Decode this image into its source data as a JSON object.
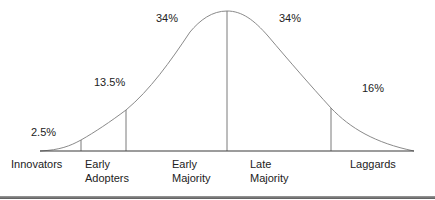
{
  "diagram": {
    "type": "bell-curve",
    "colors": {
      "curve": "#8a8a8a",
      "dividers": "#7a7a7a",
      "baseline": "#3a3a3a",
      "text": "#222222",
      "bottom_rule": "#6a6a6a"
    },
    "percentages": [
      {
        "id": "innovators",
        "value": "2.5%"
      },
      {
        "id": "early-adopters",
        "value": "13.5%"
      },
      {
        "id": "early-majority",
        "value": "34%"
      },
      {
        "id": "late-majority",
        "value": "34%"
      },
      {
        "id": "laggards",
        "value": "16%"
      }
    ],
    "categories": [
      {
        "id": "innovators",
        "line1": "Innovators",
        "line2": ""
      },
      {
        "id": "early-adopters",
        "line1": "Early",
        "line2": "Adopters"
      },
      {
        "id": "early-majority",
        "line1": "Early",
        "line2": "Majority"
      },
      {
        "id": "late-majority",
        "line1": "Late",
        "line2": "Majority"
      },
      {
        "id": "laggards",
        "line1": "Laggards",
        "line2": ""
      }
    ]
  }
}
